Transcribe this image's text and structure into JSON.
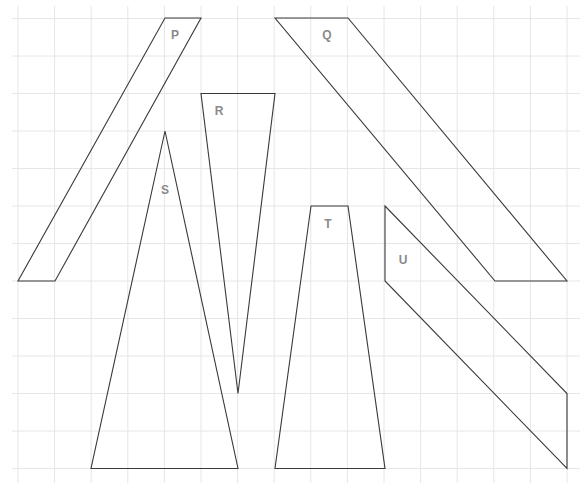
{
  "diagram": {
    "grid": {
      "x_lines": [
        18,
        54.6,
        91.2,
        127.8,
        164.4,
        201,
        237.6,
        274.2,
        310.8,
        347.4,
        384,
        420.6,
        457.2,
        493.8,
        530.4,
        567
      ],
      "y_lines": [
        18.5,
        56,
        93.5,
        131,
        168.5,
        206,
        243.5,
        281,
        318.5,
        356,
        393.5,
        431,
        468.5
      ],
      "color": "#e6e6e6"
    },
    "shapes": [
      {
        "label": "P",
        "kind": "parallelogram",
        "points": [
          [
            165,
            18
          ],
          [
            201,
            18
          ],
          [
            55,
            281
          ],
          [
            18,
            281
          ]
        ],
        "label_pos": [
          175,
          35
        ]
      },
      {
        "label": "Q",
        "kind": "parallelogram",
        "points": [
          [
            275,
            18
          ],
          [
            348,
            18
          ],
          [
            567,
            281
          ],
          [
            495,
            281
          ]
        ],
        "label_pos": [
          327,
          35
        ]
      },
      {
        "label": "R",
        "kind": "triangle",
        "points": [
          [
            201,
            93.5
          ],
          [
            275,
            93.5
          ],
          [
            238,
            393.5
          ]
        ],
        "label_pos": [
          219,
          111
        ]
      },
      {
        "label": "S",
        "kind": "triangle",
        "points": [
          [
            165,
            131
          ],
          [
            238,
            468.5
          ],
          [
            91,
            468.5
          ]
        ],
        "label_pos": [
          165,
          190
        ]
      },
      {
        "label": "T",
        "kind": "trapezoid",
        "points": [
          [
            311,
            206
          ],
          [
            348,
            206
          ],
          [
            385,
            468.5
          ],
          [
            275,
            468.5
          ]
        ],
        "label_pos": [
          328,
          224
        ]
      },
      {
        "label": "U",
        "kind": "parallelogram",
        "points": [
          [
            385,
            206
          ],
          [
            567,
            393.5
          ],
          [
            567,
            468.5
          ],
          [
            385,
            281
          ]
        ],
        "label_pos": [
          403,
          260
        ]
      }
    ],
    "stroke_color": "#3a3a3a",
    "label_color": "#8a8a8a"
  }
}
